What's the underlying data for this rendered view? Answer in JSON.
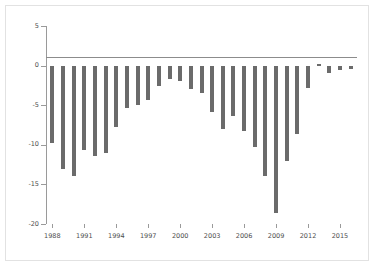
{
  "chart_data": {
    "type": "bar",
    "title": "",
    "subtitle": "",
    "xlabel": "",
    "ylabel": "",
    "grid": false,
    "legend": "none",
    "bar_color": "#6b6b6b",
    "axis_color": "#9a9a9a",
    "background": "#ffffff",
    "frame_color": "#e2e2e2",
    "ylim": [
      -20,
      5
    ],
    "yticks": [
      5,
      0,
      -5,
      -10,
      -15,
      -20
    ],
    "ytick_labels": [
      "5",
      "0",
      "-5",
      "-10",
      "-15",
      "-20"
    ],
    "xlim": [
      1987.4,
      2016.6
    ],
    "xticks": [
      1988,
      1991,
      1994,
      1997,
      2000,
      2003,
      2006,
      2009,
      2012,
      2015
    ],
    "xtick_labels": [
      "1988",
      "1991",
      "1994",
      "1997",
      "2000",
      "2003",
      "2006",
      "2009",
      "2012",
      "2015"
    ],
    "categories": [
      "1988",
      "1989",
      "1990",
      "1991",
      "1992",
      "1993",
      "1994",
      "1995",
      "1996",
      "1997",
      "1998",
      "1999",
      "2000",
      "2001",
      "2002",
      "2003",
      "2004",
      "2005",
      "2006",
      "2007",
      "2008",
      "2009",
      "2010",
      "2011",
      "2012",
      "2013",
      "2014",
      "2015",
      "2016"
    ],
    "values": [
      -9.8,
      -13.0,
      -14.0,
      -10.6,
      -11.4,
      -11.0,
      -7.8,
      -5.4,
      -5.0,
      -4.4,
      -2.6,
      -1.7,
      -1.9,
      -3.0,
      -3.4,
      -5.9,
      -8.0,
      -6.4,
      -8.2,
      -10.3,
      -14.0,
      -18.6,
      -12.0,
      -8.6,
      -2.8,
      0.2,
      -0.9,
      -0.5,
      -0.4
    ]
  }
}
